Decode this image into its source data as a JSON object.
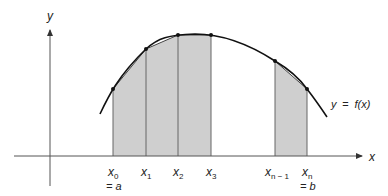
{
  "diagram": {
    "type": "riemann-trapezoid-approximation",
    "axes": {
      "x_label": "x",
      "y_label": "y"
    },
    "curve_label": {
      "lhs": "y",
      "eq": "=",
      "rhs": "f(x)"
    },
    "partition_points": [
      {
        "base": "x",
        "sub": "0",
        "extra": "= a"
      },
      {
        "base": "x",
        "sub": "1",
        "extra": ""
      },
      {
        "base": "x",
        "sub": "2",
        "extra": ""
      },
      {
        "base": "x",
        "sub": "3",
        "extra": ""
      },
      {
        "base": "x",
        "sub": "n − 1",
        "extra": ""
      },
      {
        "base": "x",
        "sub": "n",
        "extra": "= b"
      }
    ],
    "colors": {
      "shade": "#cfcfcf",
      "line": "#222222",
      "axis": "#555555"
    }
  }
}
